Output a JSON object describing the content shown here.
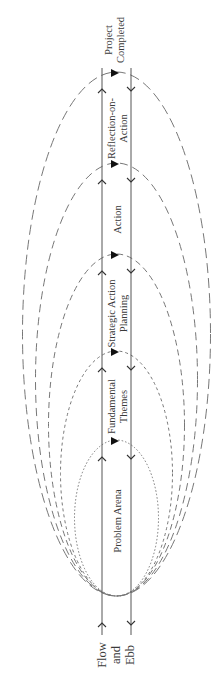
{
  "diagram": {
    "title_top": [
      "Project",
      "Completed"
    ],
    "title_bottom": [
      "Flow",
      "and",
      "Ebb"
    ],
    "stages": [
      {
        "label_lines": [
          "Reflection-on-",
          "Action"
        ],
        "top_y": 72,
        "rx": 94,
        "dash": "10 5"
      },
      {
        "label_lines": [
          "Action"
        ],
        "top_y": 163,
        "rx": 81,
        "dash": "8 5"
      },
      {
        "label_lines": [
          "Strategic Action",
          "Planning"
        ],
        "top_y": 254,
        "rx": 68,
        "dash": "6 4"
      },
      {
        "label_lines": [
          "Fundamental",
          "Themes"
        ],
        "top_y": 351,
        "rx": 56,
        "dash": "3 3"
      },
      {
        "label_lines": [
          "Problem Arena"
        ],
        "top_y": 440,
        "rx": 42,
        "dash": "1.5 2"
      }
    ],
    "colors": {
      "line": "#555555",
      "text": "#3a3a3a",
      "ellipse": "#777777"
    }
  }
}
